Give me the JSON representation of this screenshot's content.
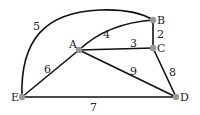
{
  "graph": {
    "nodes": [
      {
        "id": "A",
        "label": "A",
        "x": 79,
        "y": 50
      },
      {
        "id": "B",
        "label": "B",
        "x": 153,
        "y": 20
      },
      {
        "id": "C",
        "label": "C",
        "x": 153,
        "y": 48
      },
      {
        "id": "D",
        "label": "D",
        "x": 176,
        "y": 97
      },
      {
        "id": "E",
        "label": "E",
        "x": 22,
        "y": 97
      }
    ],
    "edges": [
      {
        "from": "E",
        "to": "B",
        "weight": "5"
      },
      {
        "from": "A",
        "to": "B",
        "weight": "4"
      },
      {
        "from": "B",
        "to": "C",
        "weight": "2"
      },
      {
        "from": "A",
        "to": "C",
        "weight": "3"
      },
      {
        "from": "A",
        "to": "E",
        "weight": "6"
      },
      {
        "from": "A",
        "to": "D",
        "weight": "9"
      },
      {
        "from": "C",
        "to": "D",
        "weight": "8"
      },
      {
        "from": "E",
        "to": "D",
        "weight": "7"
      }
    ]
  }
}
